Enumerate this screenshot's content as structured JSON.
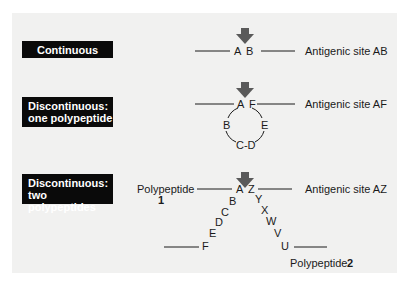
{
  "colors": {
    "panel_bg": "#f1f1f0",
    "label_box_bg": "#0a0a0a",
    "label_box_text": "#ffffff",
    "arrow": "#5a5a5a",
    "line": "#1a1a1a"
  },
  "rows": [
    {
      "type_label": "Continuous",
      "residues": [
        "A",
        "B"
      ],
      "site_label": "Antigenic site AB",
      "icon": "down-arrow-icon"
    },
    {
      "type_label_line1": "Discontinuous:",
      "type_label_line2": "one polypeptide",
      "residues_top": [
        "A",
        "F"
      ],
      "residues_loop": [
        "B",
        "E"
      ],
      "residues_bottom": "C-D",
      "site_label": "Antigenic site AF",
      "icon": "down-arrow-icon"
    },
    {
      "type_label_line1": "Discontinuous:",
      "type_label_line2": "two polypeptides",
      "polypeptide1_label": "Polypeptide",
      "polypeptide1_num": "1",
      "polypeptide2_label": "Polypeptide",
      "polypeptide2_num": "2",
      "chain1": [
        "A",
        "B",
        "C",
        "D",
        "E",
        "F"
      ],
      "chain2": [
        "Z",
        "Y",
        "X",
        "W",
        "V",
        "U"
      ],
      "site_label": "Antigenic site AZ",
      "icon": "down-arrow-icon"
    }
  ]
}
